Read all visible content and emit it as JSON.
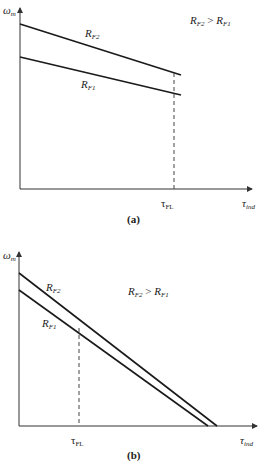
{
  "figure_a": {
    "caption": "(a)",
    "y_axis_label": {
      "main": "ω",
      "sub": "m"
    },
    "x_axis_label": {
      "main": "τ",
      "sub": "ind"
    },
    "tick_label": {
      "main": "τ",
      "sub": "FL"
    },
    "relation": {
      "a": "R",
      "a_sub": "F2",
      "op": " > ",
      "b": "R",
      "b_sub": "F1"
    },
    "curves": [
      {
        "name": "R_F2",
        "label": "R",
        "label_sub": "F2"
      },
      {
        "name": "R_F1",
        "label": "R",
        "label_sub": "F1"
      }
    ]
  },
  "figure_b": {
    "caption": "(b)",
    "y_axis_label": {
      "main": "ω",
      "sub": "m"
    },
    "x_axis_label": {
      "main": "τ",
      "sub": "ind"
    },
    "tick_label": {
      "main": "τ",
      "sub": "FL"
    },
    "relation": {
      "a": "R",
      "a_sub": "F2",
      "op": " > ",
      "b": "R",
      "b_sub": "F1"
    },
    "curves": [
      {
        "name": "R_F2",
        "label": "R",
        "label_sub": "F2"
      },
      {
        "name": "R_F1",
        "label": "R",
        "label_sub": "F1"
      }
    ]
  },
  "colors": {
    "line": "#1a1a1a",
    "axis": "#333333",
    "dashed": "#444444",
    "text": "#222222"
  }
}
